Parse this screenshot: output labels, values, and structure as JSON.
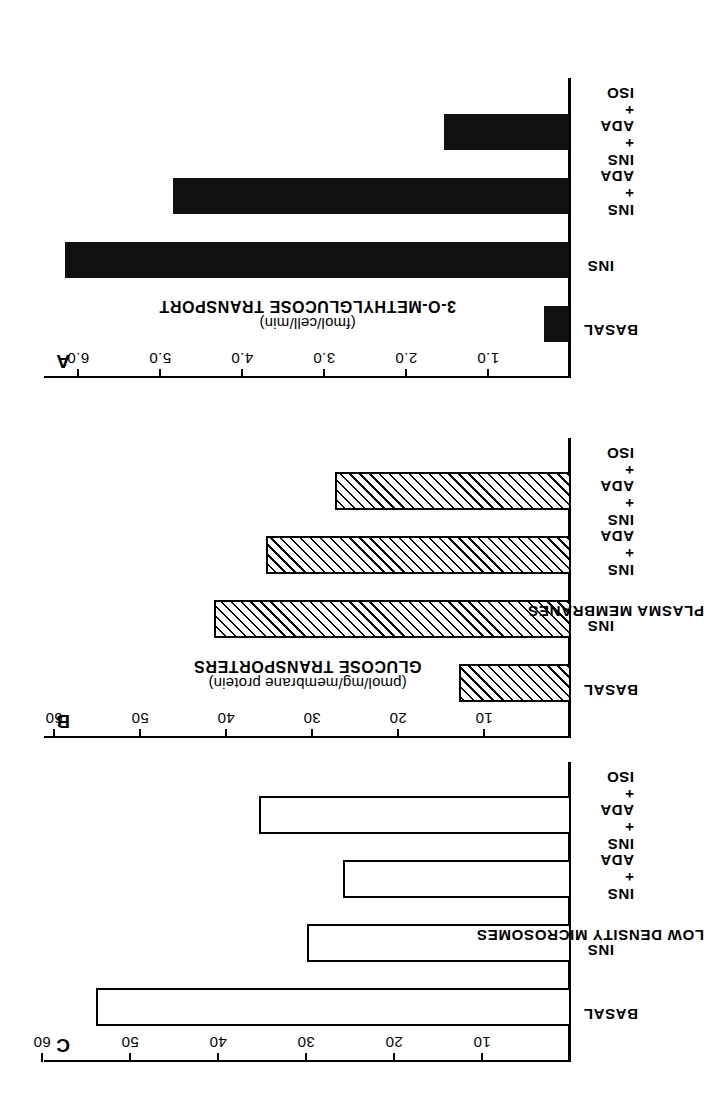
{
  "figure": {
    "rotation_note": "180",
    "panels": [
      {
        "letter": "A",
        "group_title": "",
        "axis_title": "3-O-METHYLGLUCOSE TRANSPORT",
        "axis_unit": "(fmol/cell/min)",
        "ticks": [
          "1.0",
          "2.0",
          "3.0",
          "4.0",
          "5.0",
          "6.0"
        ],
        "categories": [
          "BASAL",
          "INS",
          "INS\n+\nADA",
          "INS\n+\nADA\n+\nISO"
        ],
        "fill": "solid"
      },
      {
        "letter": "B",
        "group_title": "PLASMA MEMBRANES",
        "axis_title": "GLUCOSE TRANSPORTERS",
        "axis_unit": "(pmol/mg/membrane protein)",
        "ticks": [
          "10",
          "20",
          "30",
          "40",
          "50",
          "60"
        ],
        "categories": [
          "BASAL",
          "INS",
          "INS\n+\nADA",
          "INS\n+\nADA\n+\nISO"
        ],
        "fill": "hatch"
      },
      {
        "letter": "C",
        "group_title": "LOW DENSITY MICROSOMES",
        "axis_title": "",
        "axis_unit": "",
        "ticks": [
          "10",
          "20",
          "30",
          "40",
          "50",
          "60"
        ],
        "categories": [
          "BASAL",
          "INS",
          "INS\n+\nADA",
          "INS\n+\nADA\n+\nISO"
        ],
        "fill": "open"
      }
    ]
  },
  "chart_data": [
    {
      "type": "bar",
      "panel": "A",
      "title": "",
      "xlabel": "3-O-METHYLGLUCOSE TRANSPORT (fmol/cell/min)",
      "ylabel": "",
      "orientation": "horizontal",
      "categories": [
        "BASAL",
        "INS",
        "INS + ADA",
        "INS + ADA + ISO"
      ],
      "values": [
        0.3,
        6.1,
        4.8,
        1.5
      ],
      "xlim": [
        0,
        6.5
      ],
      "ticks": [
        1.0,
        2.0,
        3.0,
        4.0,
        5.0,
        6.0
      ],
      "bar_style": "solid black",
      "grid": false,
      "legend": "none"
    },
    {
      "type": "bar",
      "panel": "B",
      "title": "PLASMA MEMBRANES",
      "xlabel": "GLUCOSE TRANSPORTERS (pmol/mg/membrane protein)",
      "ylabel": "",
      "orientation": "horizontal",
      "categories": [
        "BASAL",
        "INS",
        "INS + ADA",
        "INS + ADA + ISO"
      ],
      "values": [
        12.5,
        41.0,
        35.0,
        27.0
      ],
      "xlim": [
        0,
        65
      ],
      "ticks": [
        10,
        20,
        30,
        40,
        50,
        60
      ],
      "bar_style": "diagonal hatch",
      "grid": false,
      "legend": "none"
    },
    {
      "type": "bar",
      "panel": "C",
      "title": "LOW DENSITY MICROSOMES",
      "xlabel": "GLUCOSE TRANSPORTERS (pmol/mg/membrane protein)",
      "ylabel": "",
      "orientation": "horizontal",
      "categories": [
        "BASAL",
        "INS",
        "INS + ADA",
        "INS + ADA + ISO"
      ],
      "values": [
        53.5,
        29.5,
        25.5,
        35.0
      ],
      "xlim": [
        0,
        65
      ],
      "ticks": [
        10,
        20,
        30,
        40,
        50,
        60
      ],
      "bar_style": "open / white",
      "grid": false,
      "legend": "none"
    }
  ]
}
